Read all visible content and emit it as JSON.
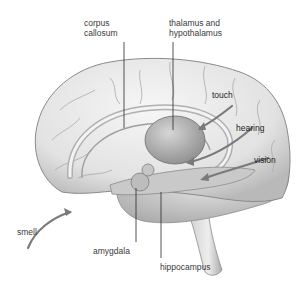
{
  "diagram": {
    "labels": {
      "corpus_callosum": [
        "corpus",
        "callosum"
      ],
      "thalamus": [
        "thalamus and",
        "hypothalamus"
      ],
      "touch": "touch",
      "hearing": "hearing",
      "vision": "vision",
      "smell": "smell",
      "amygdala": "amygdala",
      "hippocampus": "hippocampus"
    },
    "colors": {
      "background": "#ffffff",
      "brain_fill": "#e6e6e6",
      "shadow": "#9a9a9a",
      "leader_line": "#2a2a2a",
      "arrow": "#7a7a7a"
    }
  }
}
